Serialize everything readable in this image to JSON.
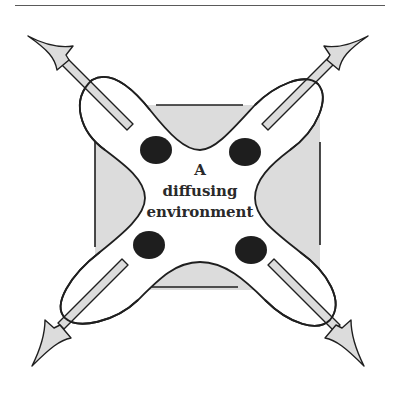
{
  "diagram": {
    "label_lines": [
      "A",
      "diffusing",
      "environment"
    ],
    "colors": {
      "fill_gray": "#dcdcdc",
      "stroke": "#1f1f1f",
      "dot": "#1e1e1e",
      "rule": "#5a5a5a"
    },
    "elements": {
      "background_square": "gray square, partly covered by lobes",
      "lobes": [
        "top-left",
        "top-right",
        "bottom-left",
        "bottom-right"
      ],
      "dots": [
        "top-left",
        "top-right",
        "bottom-left",
        "bottom-right"
      ],
      "arrows": [
        "top-left",
        "top-right",
        "bottom-left",
        "bottom-right"
      ]
    }
  }
}
